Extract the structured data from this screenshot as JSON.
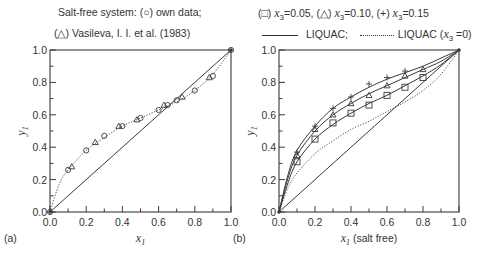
{
  "captions": {
    "left_line1": "Salt-free system: (○) own data;",
    "left_line2": "(△) Vasileva, I. I. et al. (1983)",
    "right_line1_sq": "(□) ",
    "right_line1_sq_val": "=0.05, ",
    "right_line1_tri": "(△) ",
    "right_line1_tri_val": "=0.10, ",
    "right_line1_plus": "(+) ",
    "right_line1_plus_val": "=0.15",
    "x_var": "x",
    "x_sub": "3",
    "legend_solid": "LIQUAC;",
    "legend_dotted": "LIQUAC (",
    "legend_dotted_tail": " =0)"
  },
  "chart_data": [
    {
      "panel": "(a)",
      "type": "scatter",
      "title": "Salt-free system: (○) own data; (△) Vasileva, I. I. et al. (1983)",
      "xlabel": "x1",
      "ylabel": "y1",
      "xlim": [
        0,
        1
      ],
      "ylim": [
        0,
        1
      ],
      "xticks": [
        "0.0",
        "0.2",
        "0.4",
        "0.6",
        "0.8",
        "1.0"
      ],
      "yticks": [
        "0.0",
        "0.2",
        "0.4",
        "0.6",
        "0.8",
        "1.0"
      ],
      "grid": false,
      "series": [
        {
          "name": "own data",
          "marker": "circle",
          "x": [
            0.0,
            0.1,
            0.2,
            0.3,
            0.4,
            0.5,
            0.6,
            0.65,
            0.7,
            0.8,
            0.9,
            1.0
          ],
          "y": [
            0.0,
            0.26,
            0.38,
            0.47,
            0.53,
            0.58,
            0.63,
            0.66,
            0.69,
            0.75,
            0.84,
            1.0
          ]
        },
        {
          "name": "Vasileva, I. I. et al. (1983)",
          "marker": "triangle",
          "x": [
            0.12,
            0.25,
            0.38,
            0.48,
            0.63,
            0.73,
            0.88
          ],
          "y": [
            0.28,
            0.43,
            0.53,
            0.57,
            0.66,
            0.71,
            0.83
          ]
        },
        {
          "name": "LIQUAC (salt-free)",
          "style": "dotted",
          "x": [
            0,
            0.05,
            0.1,
            0.2,
            0.3,
            0.4,
            0.5,
            0.6,
            0.7,
            0.8,
            0.9,
            1.0
          ],
          "y": [
            0,
            0.17,
            0.26,
            0.38,
            0.46,
            0.53,
            0.58,
            0.63,
            0.68,
            0.75,
            0.85,
            1.0
          ]
        },
        {
          "name": "diagonal y=x",
          "style": "solid",
          "x": [
            0,
            1
          ],
          "y": [
            0,
            1
          ]
        }
      ]
    },
    {
      "panel": "(b)",
      "type": "scatter",
      "title": "(□) x3=0.05, (△) x3=0.10, (+) x3=0.15; — LIQUAC; ··· LIQUAC (x3=0)",
      "xlabel": "x1 (salt free)",
      "ylabel": "y1",
      "xlim": [
        0,
        1
      ],
      "ylim": [
        0,
        1
      ],
      "xticks": [
        "0.0",
        "0.2",
        "0.4",
        "0.6",
        "0.8",
        "1.0"
      ],
      "yticks": [
        "0.0",
        "0.2",
        "0.4",
        "0.6",
        "0.8",
        "1.0"
      ],
      "grid": false,
      "series": [
        {
          "name": "x3=0.05",
          "marker": "square",
          "x": [
            0.1,
            0.2,
            0.3,
            0.4,
            0.5,
            0.6,
            0.7,
            0.8
          ],
          "y": [
            0.31,
            0.45,
            0.55,
            0.61,
            0.66,
            0.72,
            0.77,
            0.83
          ]
        },
        {
          "name": "x3=0.10",
          "marker": "triangle",
          "x": [
            0.1,
            0.2,
            0.3,
            0.4,
            0.5,
            0.6,
            0.7,
            0.8
          ],
          "y": [
            0.35,
            0.51,
            0.6,
            0.67,
            0.72,
            0.78,
            0.84,
            0.88
          ]
        },
        {
          "name": "x3=0.15",
          "marker": "plus",
          "x": [
            0.1,
            0.2,
            0.3,
            0.4,
            0.5,
            0.6,
            0.7
          ],
          "y": [
            0.37,
            0.53,
            0.64,
            0.71,
            0.79,
            0.83,
            0.87
          ]
        },
        {
          "name": "LIQUAC x3=0.05",
          "style": "solid",
          "x": [
            0,
            0.05,
            0.1,
            0.2,
            0.3,
            0.4,
            0.5,
            0.6,
            0.7,
            0.8,
            0.9,
            1.0
          ],
          "y": [
            0,
            0.18,
            0.31,
            0.45,
            0.54,
            0.61,
            0.67,
            0.72,
            0.78,
            0.84,
            0.91,
            1.0
          ]
        },
        {
          "name": "LIQUAC x3=0.10",
          "style": "solid",
          "x": [
            0,
            0.05,
            0.1,
            0.2,
            0.3,
            0.4,
            0.5,
            0.6,
            0.7,
            0.8,
            0.9,
            1.0
          ],
          "y": [
            0,
            0.21,
            0.35,
            0.5,
            0.6,
            0.67,
            0.73,
            0.78,
            0.83,
            0.88,
            0.93,
            1.0
          ]
        },
        {
          "name": "LIQUAC x3=0.15",
          "style": "solid",
          "x": [
            0,
            0.05,
            0.1,
            0.2,
            0.3,
            0.4,
            0.5,
            0.6,
            0.7,
            0.8,
            0.9,
            1.0
          ],
          "y": [
            0,
            0.23,
            0.38,
            0.53,
            0.64,
            0.71,
            0.77,
            0.82,
            0.86,
            0.9,
            0.95,
            1.0
          ]
        },
        {
          "name": "LIQUAC (x3=0)",
          "style": "dotted",
          "x": [
            0,
            0.05,
            0.1,
            0.2,
            0.3,
            0.4,
            0.5,
            0.6,
            0.7,
            0.8,
            0.9,
            1.0
          ],
          "y": [
            0,
            0.15,
            0.24,
            0.36,
            0.44,
            0.51,
            0.56,
            0.62,
            0.68,
            0.75,
            0.85,
            1.0
          ]
        },
        {
          "name": "diagonal y=x",
          "style": "solid",
          "x": [
            0,
            1
          ],
          "y": [
            0,
            1
          ]
        }
      ]
    }
  ],
  "panels": [
    {
      "label": "(a)",
      "xlabel_var": "x",
      "xlabel_sub": "1",
      "xlabel_suffix": "",
      "ylabel_var": "y",
      "ylabel_sub": "1",
      "ticks": [
        "0.0",
        "0.2",
        "0.4",
        "0.6",
        "0.8",
        "1.0"
      ]
    },
    {
      "label": "(b)",
      "xlabel_var": "x",
      "xlabel_sub": "1",
      "xlabel_suffix": " (salt free)",
      "ylabel_var": "y",
      "ylabel_sub": "1",
      "ticks": [
        "0.0",
        "0.2",
        "0.4",
        "0.6",
        "0.8",
        "1.0"
      ]
    }
  ]
}
